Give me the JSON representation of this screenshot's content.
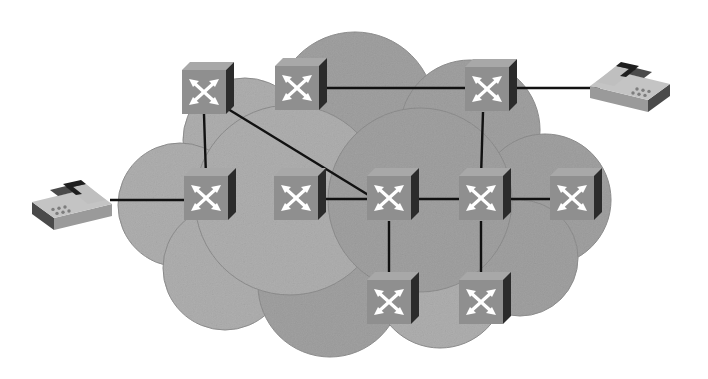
{
  "figure": {
    "type": "network-topology-diagram",
    "canvas": {
      "width": 708,
      "height": 379,
      "background": "#ffffff"
    }
  },
  "palette": {
    "page_background": "#ffffff",
    "cloud_fill": "#c9c9c9",
    "cloud_fill_light": "#d2d2d2",
    "cloud_edge": "#bdbdbd",
    "device_face": "#8f8f8f",
    "device_top": "#a8a8a8",
    "device_side": "#2b2b2b",
    "device_arrow": "#ffffff",
    "link_stroke": "#111111",
    "phone_base": "#9a9a9a",
    "phone_base_top": "#c4c4c4",
    "phone_side": "#4a4a4a",
    "phone_handset": "#bfbfbf",
    "phone_handset_shadow": "#1e1e1e",
    "phone_keypad": "#7d7d7d"
  },
  "cloud": {
    "name": "network-cloud",
    "label": "",
    "center_x": 354,
    "center_y": 196,
    "lobes": [
      {
        "cx": 355,
        "cy": 112,
        "r": 80
      },
      {
        "cx": 245,
        "cy": 140,
        "r": 62
      },
      {
        "cx": 470,
        "cy": 130,
        "r": 70
      },
      {
        "cx": 180,
        "cy": 205,
        "r": 62
      },
      {
        "cx": 545,
        "cy": 200,
        "r": 66
      },
      {
        "cx": 225,
        "cy": 268,
        "r": 62
      },
      {
        "cx": 330,
        "cy": 285,
        "r": 72
      },
      {
        "cx": 440,
        "cy": 282,
        "r": 66
      },
      {
        "cx": 520,
        "cy": 258,
        "r": 58
      },
      {
        "cx": 290,
        "cy": 200,
        "r": 95
      },
      {
        "cx": 420,
        "cy": 200,
        "r": 92
      }
    ]
  },
  "devices": {
    "switch_icon_name": "network-switch-icon",
    "size": 44,
    "items": [
      {
        "id": "sw-top-1",
        "name": "switch-top-left",
        "label": "",
        "x": 204,
        "y": 92
      },
      {
        "id": "sw-top-2",
        "name": "switch-top-center",
        "label": "",
        "x": 297,
        "y": 88
      },
      {
        "id": "sw-top-3",
        "name": "switch-top-right",
        "label": "",
        "x": 487,
        "y": 89
      },
      {
        "id": "sw-mid-1",
        "name": "switch-mid-far-left",
        "label": "",
        "x": 206,
        "y": 198
      },
      {
        "id": "sw-mid-2",
        "name": "switch-mid-left",
        "label": "",
        "x": 296,
        "y": 198
      },
      {
        "id": "sw-mid-3",
        "name": "switch-mid-center",
        "label": "",
        "x": 389,
        "y": 198
      },
      {
        "id": "sw-mid-4",
        "name": "switch-mid-right",
        "label": "",
        "x": 481,
        "y": 198
      },
      {
        "id": "sw-mid-5",
        "name": "switch-mid-far-right",
        "label": "",
        "x": 572,
        "y": 198
      },
      {
        "id": "sw-bot-1",
        "name": "switch-bottom-left",
        "label": "",
        "x": 389,
        "y": 302
      },
      {
        "id": "sw-bot-2",
        "name": "switch-bottom-right",
        "label": "",
        "x": 481,
        "y": 302
      }
    ]
  },
  "endpoints": {
    "phone_icon_name": "desk-phone-icon",
    "items": [
      {
        "id": "phone-right",
        "name": "desk-phone-top-right",
        "label": "",
        "x": 630,
        "y": 82,
        "flip": false
      },
      {
        "id": "phone-left",
        "name": "desk-phone-mid-left",
        "label": "",
        "x": 72,
        "y": 200,
        "flip": true
      }
    ]
  },
  "links": [
    {
      "name": "link-top-center-to-top-right",
      "from": "sw-top-2",
      "to": "sw-top-3",
      "x1": 320,
      "y1": 88,
      "x2": 466,
      "y2": 88
    },
    {
      "name": "link-top-right-to-phone-right",
      "from": "sw-top-3",
      "to": "phone-right",
      "x1": 510,
      "y1": 88,
      "x2": 600,
      "y2": 88
    },
    {
      "name": "link-top-left-to-mid-far-left",
      "from": "sw-top-1",
      "to": "sw-mid-1",
      "x1": 204,
      "y1": 114,
      "x2": 206,
      "y2": 177
    },
    {
      "name": "link-top-left-to-mid-center",
      "from": "sw-top-1",
      "to": "sw-mid-3",
      "x1": 228,
      "y1": 109,
      "x2": 370,
      "y2": 196
    },
    {
      "name": "link-top-right-to-mid-right",
      "from": "sw-top-3",
      "to": "sw-mid-4",
      "x1": 483,
      "y1": 112,
      "x2": 481,
      "y2": 177
    },
    {
      "name": "link-mid-left-to-mid-center",
      "from": "sw-mid-2",
      "to": "sw-mid-3",
      "x1": 320,
      "y1": 199,
      "x2": 368,
      "y2": 199
    },
    {
      "name": "link-mid-center-to-mid-right",
      "from": "sw-mid-3",
      "to": "sw-mid-4",
      "x1": 412,
      "y1": 199,
      "x2": 460,
      "y2": 199
    },
    {
      "name": "link-mid-right-to-mid-far-right",
      "from": "sw-mid-4",
      "to": "sw-mid-5",
      "x1": 504,
      "y1": 199,
      "x2": 551,
      "y2": 199
    },
    {
      "name": "link-mid-far-left-to-phone-left",
      "from": "sw-mid-1",
      "to": "phone-left",
      "x1": 185,
      "y1": 200,
      "x2": 110,
      "y2": 200
    },
    {
      "name": "link-mid-center-to-bottom-left",
      "from": "sw-mid-3",
      "to": "sw-bot-1",
      "x1": 389,
      "y1": 221,
      "x2": 389,
      "y2": 281
    },
    {
      "name": "link-mid-right-to-bottom-right",
      "from": "sw-mid-4",
      "to": "sw-bot-2",
      "x1": 481,
      "y1": 221,
      "x2": 481,
      "y2": 281
    }
  ]
}
